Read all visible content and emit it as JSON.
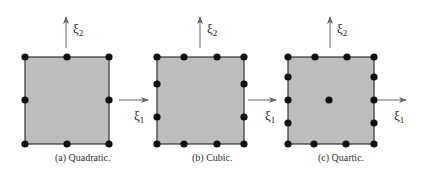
{
  "colors": {
    "fill": "#bdbdbd",
    "stroke": "#333333",
    "node": "#111111",
    "arrow": "#666666"
  },
  "axes": {
    "xi1": "ξ",
    "xi1_sub": "1",
    "xi2": "ξ",
    "xi2_sub": "2"
  },
  "panels": [
    {
      "id": "a",
      "caption": "(a) Quadratic.",
      "square": {
        "x0": 25,
        "y0": 57,
        "x1": 109,
        "y1": 144
      },
      "nodes_per_horizontal_edge": 3,
      "nodes_per_vertical_edge": 3,
      "interior_nodes": 0
    },
    {
      "id": "b",
      "caption": "(b) Cubic.",
      "square": {
        "x0": 157,
        "y0": 57,
        "x1": 244,
        "y1": 144
      },
      "nodes_per_horizontal_edge": 4,
      "nodes_per_vertical_edge": 4,
      "interior_nodes": 0
    },
    {
      "id": "c",
      "caption": "(c) Quartic.",
      "square": {
        "x0": 288,
        "y0": 57,
        "x1": 374,
        "y1": 144
      },
      "nodes_per_horizontal_edge": 4,
      "nodes_per_vertical_edge": 5,
      "interior_nodes": 1
    }
  ]
}
